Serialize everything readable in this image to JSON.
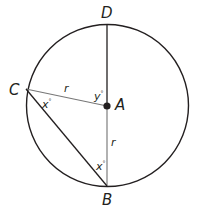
{
  "diagram": {
    "type": "circle-geometry",
    "colors": {
      "stroke": "#231f20",
      "inner_line": "#777777",
      "background": "#ffffff"
    },
    "circle": {
      "cx": 107.5,
      "cy": 105.5,
      "r": 81
    },
    "points": {
      "A": {
        "label": "A",
        "x": 107,
        "y": 106,
        "role": "center"
      },
      "B": {
        "label": "B",
        "x": 107,
        "y": 186
      },
      "C": {
        "label": "C",
        "x": 26,
        "y": 89
      },
      "D": {
        "label": "D",
        "x": 107,
        "y": 25
      }
    },
    "segments": [
      {
        "from": "D",
        "to": "A"
      },
      {
        "from": "A",
        "to": "B",
        "label": "r"
      },
      {
        "from": "C",
        "to": "A",
        "label": "r"
      },
      {
        "from": "C",
        "to": "B"
      }
    ],
    "angle_labels": {
      "angle_C": {
        "text": "x",
        "degree": "°",
        "at": "C"
      },
      "angle_B": {
        "text": "x",
        "degree": "°",
        "at": "B"
      },
      "angle_A": {
        "text": "y",
        "degree": "°",
        "at": "A"
      }
    },
    "segment_labels": {
      "CA": "r",
      "AB": "r"
    }
  }
}
